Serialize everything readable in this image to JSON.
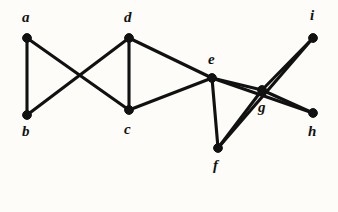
{
  "figure": {
    "kind": "undirected-graph-diagram",
    "background_color": "#fdfcf8",
    "ink_color": "#111111",
    "width": 338,
    "height": 212
  },
  "graph": {
    "vertex_count": 9,
    "edge_count": 13,
    "vertices": [
      {
        "id": "a",
        "label": "a",
        "x": 27,
        "y": 38,
        "label_x": 22,
        "label_y": 10,
        "degree": 2
      },
      {
        "id": "b",
        "label": "b",
        "x": 27,
        "y": 115,
        "label_x": 22,
        "label_y": 124,
        "degree": 2
      },
      {
        "id": "c",
        "label": "c",
        "x": 129,
        "y": 110,
        "label_x": 124,
        "label_y": 122,
        "degree": 3
      },
      {
        "id": "d",
        "label": "d",
        "x": 129,
        "y": 38,
        "label_x": 124,
        "label_y": 10,
        "degree": 3
      },
      {
        "id": "e",
        "label": "e",
        "x": 212,
        "y": 78,
        "label_x": 208,
        "label_y": 52,
        "degree": 5
      },
      {
        "id": "f",
        "label": "f",
        "x": 218,
        "y": 148,
        "label_x": 213,
        "label_y": 158,
        "degree": 3
      },
      {
        "id": "g",
        "label": "g",
        "x": 262,
        "y": 90,
        "label_x": 258,
        "label_y": 100,
        "degree": 4
      },
      {
        "id": "h",
        "label": "h",
        "x": 313,
        "y": 113,
        "label_x": 308,
        "label_y": 124,
        "degree": 2
      },
      {
        "id": "i",
        "label": "i",
        "x": 313,
        "y": 38,
        "label_x": 310,
        "label_y": 8,
        "degree": 2
      }
    ],
    "edges": [
      {
        "from": "a",
        "to": "b"
      },
      {
        "from": "a",
        "to": "c"
      },
      {
        "from": "b",
        "to": "d"
      },
      {
        "from": "c",
        "to": "d"
      },
      {
        "from": "c",
        "to": "e"
      },
      {
        "from": "d",
        "to": "e"
      },
      {
        "from": "e",
        "to": "f"
      },
      {
        "from": "e",
        "to": "g"
      },
      {
        "from": "e",
        "to": "h"
      },
      {
        "from": "f",
        "to": "g"
      },
      {
        "from": "f",
        "to": "i"
      },
      {
        "from": "g",
        "to": "i"
      },
      {
        "from": "g",
        "to": "h"
      }
    ],
    "vertex_radius": 4.4
  }
}
